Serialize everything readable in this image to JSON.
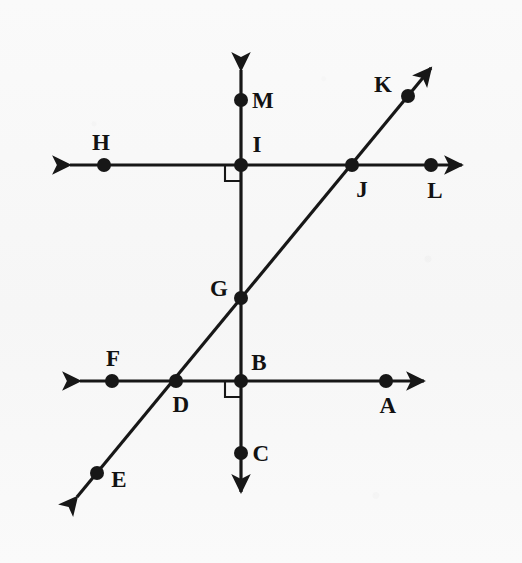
{
  "figure": {
    "canvas": {
      "width": 522,
      "height": 563
    },
    "background_color": "#fbfbfb",
    "ink_color": "#171717",
    "line_width": 3.2,
    "point_radius": 7.0
  },
  "points": [
    {
      "id": "A",
      "label": "A",
      "x": 386,
      "y": 381,
      "label_x": 388,
      "label_y": 405,
      "on": [
        "line-DB-horizontal"
      ]
    },
    {
      "id": "B",
      "label": "B",
      "x": 241,
      "y": 381,
      "label_x": 259,
      "label_y": 362,
      "on": [
        "line-DB-horizontal",
        "line-MC-vertical"
      ]
    },
    {
      "id": "C",
      "label": "C",
      "x": 241,
      "y": 453,
      "label_x": 261,
      "label_y": 453,
      "on": [
        "line-MC-vertical"
      ]
    },
    {
      "id": "D",
      "label": "D",
      "x": 176,
      "y": 381,
      "label_x": 181,
      "label_y": 404,
      "on": [
        "line-DB-horizontal",
        "line-EK-diagonal"
      ]
    },
    {
      "id": "E",
      "label": "E",
      "x": 97,
      "y": 473,
      "label_x": 119,
      "label_y": 479,
      "on": [
        "line-EK-diagonal"
      ]
    },
    {
      "id": "F",
      "label": "F",
      "x": 112,
      "y": 381,
      "label_x": 113,
      "label_y": 358,
      "on": [
        "line-DB-horizontal"
      ]
    },
    {
      "id": "G",
      "label": "G",
      "x": 241,
      "y": 298,
      "label_x": 219,
      "label_y": 288,
      "on": [
        "line-MC-vertical",
        "line-EK-diagonal"
      ]
    },
    {
      "id": "H",
      "label": "H",
      "x": 104,
      "y": 165,
      "label_x": 101,
      "label_y": 142,
      "on": [
        "line-HL-horizontal"
      ]
    },
    {
      "id": "I",
      "label": "I",
      "x": 241,
      "y": 165,
      "label_x": 257,
      "label_y": 144,
      "on": [
        "line-HL-horizontal",
        "line-MC-vertical"
      ]
    },
    {
      "id": "J",
      "label": "J",
      "x": 352,
      "y": 165,
      "label_x": 362,
      "label_y": 189,
      "on": [
        "line-HL-horizontal",
        "line-EK-diagonal"
      ]
    },
    {
      "id": "K",
      "label": "K",
      "x": 408,
      "y": 96,
      "label_x": 383,
      "label_y": 84,
      "on": [
        "line-EK-diagonal"
      ]
    },
    {
      "id": "L",
      "label": "L",
      "x": 431,
      "y": 165,
      "label_x": 435,
      "label_y": 190,
      "on": [
        "line-HL-horizontal"
      ]
    },
    {
      "id": "M",
      "label": "M",
      "x": 241,
      "y": 100,
      "label_x": 263,
      "label_y": 100,
      "on": [
        "line-MC-vertical"
      ]
    }
  ],
  "lines": [
    {
      "id": "line-HL-horizontal",
      "name": "upper-horizontal-line",
      "x1": 70,
      "y1": 165,
      "x2": 462,
      "y2": 165,
      "arrow_start": true,
      "arrow_end": true,
      "through_points": [
        "H",
        "I",
        "J",
        "L"
      ]
    },
    {
      "id": "line-DB-horizontal",
      "name": "lower-horizontal-line",
      "x1": 80,
      "y1": 381,
      "x2": 424,
      "y2": 381,
      "arrow_start": true,
      "arrow_end": true,
      "through_points": [
        "F",
        "D",
        "B",
        "A"
      ]
    },
    {
      "id": "line-MC-vertical",
      "name": "vertical-line",
      "x1": 241,
      "y1": 70,
      "x2": 241,
      "y2": 492,
      "arrow_start": true,
      "arrow_end": true,
      "through_points": [
        "M",
        "I",
        "G",
        "B",
        "C"
      ]
    },
    {
      "id": "line-EK-diagonal",
      "name": "diagonal-transversal-line",
      "x1": 77,
      "y1": 497,
      "x2": 431,
      "y2": 68,
      "arrow_start": true,
      "arrow_end": true,
      "through_points": [
        "E",
        "D",
        "G",
        "J",
        "K"
      ]
    }
  ],
  "right_angle_marks": [
    {
      "id": "right-angle-at-I",
      "at_point": "I",
      "x": 241,
      "y": 165,
      "quadrant": "lower-left",
      "size": 16
    },
    {
      "id": "right-angle-at-B",
      "at_point": "B",
      "x": 241,
      "y": 381,
      "quadrant": "lower-left",
      "size": 16
    }
  ]
}
